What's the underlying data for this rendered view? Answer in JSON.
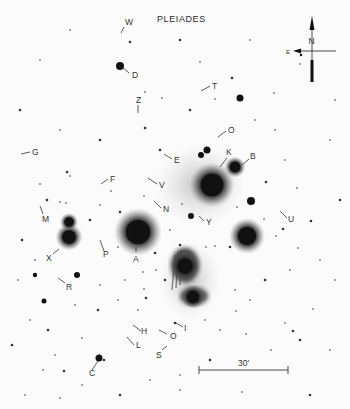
{
  "title": "PLEIADES",
  "compass": {
    "north_label": "N",
    "east_label": "E",
    "x": 312,
    "y": 50
  },
  "scale_bar": {
    "label": "30'",
    "x1": 199,
    "x2": 288,
    "y": 370
  },
  "colors": {
    "background": "#fbfbfb",
    "star": "#111111",
    "ink": "#333333",
    "nebula": "#555555"
  },
  "bright_stars": [
    {
      "name": "alcyone",
      "x": 212,
      "y": 185,
      "r": 15
    },
    {
      "name": "A-star",
      "x": 138,
      "y": 232,
      "r": 16
    },
    {
      "name": "east-bright",
      "x": 247,
      "y": 236,
      "r": 12
    },
    {
      "name": "X-star",
      "x": 69,
      "y": 237,
      "r": 9
    },
    {
      "name": "X-pair-upper",
      "x": 69,
      "y": 222,
      "r": 6
    },
    {
      "name": "B-star",
      "x": 235,
      "y": 167,
      "r": 7
    },
    {
      "name": "merope",
      "x": 185,
      "y": 266,
      "r": 10
    },
    {
      "name": "merope-lower",
      "x": 193,
      "y": 297,
      "r": 8
    },
    {
      "name": "D-star",
      "x": 120,
      "y": 66,
      "r": 4
    },
    {
      "name": "T-region",
      "x": 240,
      "y": 98,
      "r": 3.5
    },
    {
      "name": "O-pair-a",
      "x": 207,
      "y": 150,
      "r": 3.5
    },
    {
      "name": "O-pair-b",
      "x": 201,
      "y": 155,
      "r": 3
    },
    {
      "name": "C-star",
      "x": 99,
      "y": 358,
      "r": 3.5
    },
    {
      "name": "east-mid",
      "x": 251,
      "y": 201,
      "r": 4
    },
    {
      "name": "Y-star",
      "x": 191,
      "y": 216,
      "r": 3
    },
    {
      "name": "west-R",
      "x": 77,
      "y": 275,
      "r": 3
    },
    {
      "name": "west-low",
      "x": 44,
      "y": 301,
      "r": 2.5
    },
    {
      "name": "west-R2",
      "x": 35,
      "y": 275,
      "r": 2.2
    }
  ],
  "labels": [
    {
      "text": "W",
      "x": 125,
      "y": 25,
      "lx1": 124,
      "ly1": 27,
      "lx2": 121,
      "ly2": 33
    },
    {
      "text": "D",
      "x": 132,
      "y": 78,
      "lx1": 122,
      "ly1": 67,
      "lx2": 129,
      "ly2": 73
    },
    {
      "text": "T",
      "x": 212,
      "y": 89,
      "lx1": 210,
      "ly1": 86,
      "lx2": 201,
      "ly2": 91
    },
    {
      "text": "Z",
      "x": 136,
      "y": 103,
      "lx1": 138,
      "ly1": 105,
      "lx2": 138,
      "ly2": 113
    },
    {
      "text": "O",
      "x": 228,
      "y": 133,
      "lx1": 226,
      "ly1": 131,
      "lx2": 218,
      "ly2": 137
    },
    {
      "text": "G",
      "x": 32,
      "y": 155,
      "lx1": 30,
      "ly1": 152,
      "lx2": 21,
      "ly2": 154
    },
    {
      "text": "E",
      "x": 174,
      "y": 163,
      "lx1": 172,
      "ly1": 159,
      "lx2": 164,
      "ly2": 154
    },
    {
      "text": "K",
      "x": 226,
      "y": 155,
      "lx1": 227,
      "ly1": 158,
      "lx2": 220,
      "ly2": 167
    },
    {
      "text": "B",
      "x": 250,
      "y": 159,
      "lx1": 249,
      "ly1": 159,
      "lx2": 242,
      "ly2": 165
    },
    {
      "text": "F",
      "x": 110,
      "y": 182,
      "lx1": 108,
      "ly1": 179,
      "lx2": 101,
      "ly2": 184
    },
    {
      "text": "V",
      "x": 159,
      "y": 188,
      "lx1": 157,
      "ly1": 184,
      "lx2": 148,
      "ly2": 178
    },
    {
      "text": "N",
      "x": 163,
      "y": 212,
      "lx1": 161,
      "ly1": 208,
      "lx2": 154,
      "ly2": 201
    },
    {
      "text": "M",
      "x": 42,
      "y": 222,
      "lx1": 43,
      "ly1": 214,
      "lx2": 40,
      "ly2": 206
    },
    {
      "text": "U",
      "x": 288,
      "y": 222,
      "lx1": 287,
      "ly1": 218,
      "lx2": 280,
      "ly2": 211
    },
    {
      "text": "Y",
      "x": 206,
      "y": 225,
      "lx1": 204,
      "ly1": 221,
      "lx2": 199,
      "ly2": 216
    },
    {
      "text": "P",
      "x": 103,
      "y": 257,
      "lx1": 104,
      "ly1": 251,
      "lx2": 100,
      "ly2": 240
    },
    {
      "text": "X",
      "x": 46,
      "y": 261,
      "lx1": 53,
      "ly1": 254,
      "lx2": 59,
      "ly2": 249
    },
    {
      "text": "A",
      "x": 133,
      "y": 262,
      "lx1": 136,
      "ly1": 252,
      "lx2": 136,
      "ly2": 247
    },
    {
      "text": "R",
      "x": 66,
      "y": 290,
      "lx1": 65,
      "ly1": 283,
      "lx2": 58,
      "ly2": 278
    },
    {
      "text": "I",
      "x": 184,
      "y": 331,
      "lx1": 183,
      "ly1": 327,
      "lx2": 176,
      "ly2": 323
    },
    {
      "text": "H",
      "x": 141,
      "y": 334,
      "lx1": 141,
      "ly1": 331,
      "lx2": 133,
      "ly2": 325
    },
    {
      "text": "O",
      "x": 170,
      "y": 339,
      "lx1": 167,
      "ly1": 334,
      "lx2": 159,
      "ly2": 330
    },
    {
      "text": "L",
      "x": 136,
      "y": 348,
      "lx1": 134,
      "ly1": 345,
      "lx2": 127,
      "ly2": 337
    },
    {
      "text": "S",
      "x": 156,
      "y": 358,
      "lx1": 162,
      "ly1": 350,
      "lx2": 167,
      "ly2": 346
    },
    {
      "text": "C",
      "x": 89,
      "y": 376,
      "lx1": 92,
      "ly1": 370,
      "lx2": 98,
      "ly2": 361
    }
  ],
  "faint_stars": [
    [
      130,
      42
    ],
    [
      145,
      92
    ],
    [
      162,
      98
    ],
    [
      190,
      110
    ],
    [
      274,
      93
    ],
    [
      200,
      62
    ],
    [
      232,
      78
    ],
    [
      215,
      99
    ],
    [
      300,
      64
    ],
    [
      145,
      128
    ],
    [
      40,
      184
    ],
    [
      70,
      176
    ],
    [
      67,
      172
    ],
    [
      66,
      203
    ],
    [
      60,
      202
    ],
    [
      47,
      200
    ],
    [
      144,
      196
    ],
    [
      111,
      191
    ],
    [
      120,
      212
    ],
    [
      182,
      204
    ],
    [
      237,
      207
    ],
    [
      266,
      182
    ],
    [
      285,
      160
    ],
    [
      297,
      188
    ],
    [
      283,
      229
    ],
    [
      276,
      236
    ],
    [
      264,
      219
    ],
    [
      311,
      221
    ],
    [
      298,
      248
    ],
    [
      215,
      246
    ],
    [
      230,
      247
    ],
    [
      206,
      247
    ],
    [
      118,
      247
    ],
    [
      155,
      253
    ],
    [
      156,
      270
    ],
    [
      143,
      272
    ],
    [
      146,
      298
    ],
    [
      144,
      289
    ],
    [
      138,
      310
    ],
    [
      175,
      323
    ],
    [
      236,
      311
    ],
    [
      285,
      323
    ],
    [
      293,
      331
    ],
    [
      246,
      334
    ],
    [
      271,
      350
    ],
    [
      300,
      340
    ],
    [
      313,
      309
    ],
    [
      82,
      338
    ],
    [
      64,
      371
    ],
    [
      82,
      385
    ],
    [
      43,
      370
    ],
    [
      48,
      330
    ],
    [
      75,
      305
    ],
    [
      100,
      285
    ],
    [
      22,
      240
    ],
    [
      18,
      280
    ],
    [
      30,
      320
    ],
    [
      12,
      345
    ],
    [
      25,
      395
    ],
    [
      60,
      398
    ],
    [
      120,
      395
    ],
    [
      180,
      390
    ],
    [
      242,
      392
    ],
    [
      310,
      395
    ],
    [
      330,
      350
    ],
    [
      335,
      280
    ],
    [
      340,
      200
    ],
    [
      330,
      140
    ],
    [
      335,
      100
    ],
    [
      20,
      110
    ],
    [
      40,
      60
    ],
    [
      70,
      30
    ],
    [
      180,
      40
    ],
    [
      250,
      40
    ],
    [
      60,
      130
    ],
    [
      100,
      140
    ],
    [
      255,
      120
    ],
    [
      275,
      130
    ],
    [
      160,
      150
    ],
    [
      220,
      330
    ],
    [
      205,
      320
    ],
    [
      165,
      280
    ],
    [
      125,
      280
    ],
    [
      118,
      300
    ],
    [
      98,
      310
    ],
    [
      290,
      270
    ],
    [
      320,
      260
    ],
    [
      265,
      280
    ],
    [
      235,
      290
    ],
    [
      250,
      300
    ],
    [
      210,
      360
    ],
    [
      180,
      375
    ],
    [
      150,
      380
    ],
    [
      104,
      360
    ],
    [
      55,
      355
    ],
    [
      35,
      260
    ],
    [
      90,
      220
    ],
    [
      100,
      205
    ],
    [
      170,
      230
    ],
    [
      180,
      245
    ]
  ]
}
